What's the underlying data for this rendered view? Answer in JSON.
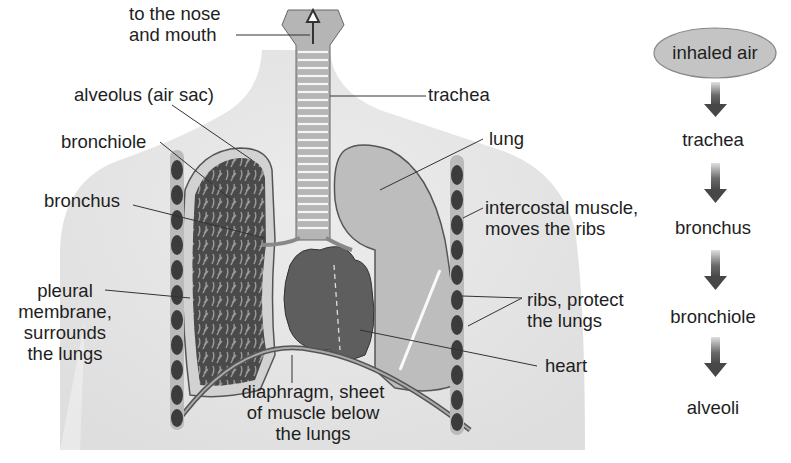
{
  "diagram": {
    "labels": {
      "nose_mouth": [
        "to the nose",
        "and mouth"
      ],
      "trachea": "trachea",
      "alveolus": "alveolus (air sac)",
      "bronchiole": "bronchiole",
      "lung": "lung",
      "bronchus": "bronchus",
      "intercostal": [
        "intercostal muscle,",
        "moves the ribs"
      ],
      "pleural": [
        "pleural",
        "membrane,",
        "surrounds",
        "the lungs"
      ],
      "ribs": [
        "ribs, protect",
        "the lungs"
      ],
      "heart": "heart",
      "diaphragm": [
        "diaphragm, sheet",
        "of muscle below",
        "the lungs"
      ]
    },
    "flow": {
      "start": "inhaled air",
      "steps": [
        "trachea",
        "bronchus",
        "bronchiole",
        "alveoli"
      ]
    },
    "colors": {
      "body": "#e6e6e6",
      "lung_left": "#4a4a4a",
      "lung_right": "#b8b8b8",
      "heart": "#5e5e5e",
      "ellipse_fill": "#c4c4c4",
      "arrow": "#4d4d4d",
      "line": "#333333"
    }
  }
}
